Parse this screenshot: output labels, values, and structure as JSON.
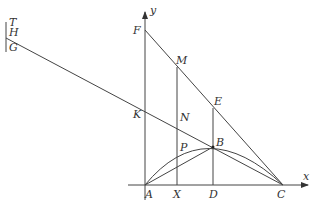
{
  "diagram": {
    "type": "geometry-figure",
    "axes": {
      "x_label": "x",
      "y_label": "y"
    },
    "points": {
      "T": {
        "label": "T",
        "x": 8,
        "y": 22
      },
      "H": {
        "label": "H",
        "x": 8,
        "y": 32
      },
      "G": {
        "label": "G",
        "x": 8,
        "y": 48
      },
      "F": {
        "label": "F",
        "x": 145,
        "y": 30
      },
      "M": {
        "label": "M",
        "x": 177,
        "y": 67
      },
      "E": {
        "label": "E",
        "x": 213,
        "y": 108
      },
      "K": {
        "label": "K",
        "x": 145,
        "y": 107
      },
      "N": {
        "label": "N",
        "x": 177,
        "y": 124
      },
      "P": {
        "label": "P",
        "x": 177,
        "y": 153
      },
      "B": {
        "label": "B",
        "x": 213,
        "y": 147
      },
      "A": {
        "label": "A",
        "x": 145,
        "y": 185
      },
      "X": {
        "label": "X",
        "x": 177,
        "y": 185
      },
      "D": {
        "label": "D",
        "x": 213,
        "y": 185
      },
      "C": {
        "label": "C",
        "x": 283,
        "y": 185
      }
    },
    "colors": {
      "stroke": "#444444",
      "text": "#333333",
      "background": "#ffffff"
    }
  }
}
